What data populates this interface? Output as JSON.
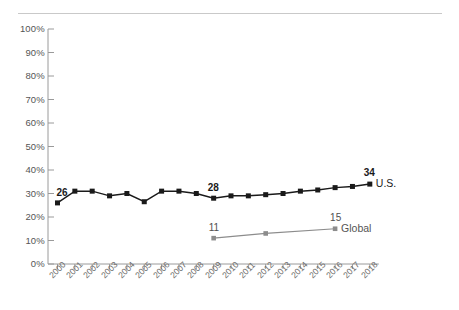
{
  "chart_data": {
    "type": "line",
    "title": "",
    "subtitle": "",
    "xlabel": "",
    "ylabel": "",
    "ylim": [
      0,
      100
    ],
    "grid": false,
    "legend_position": "right-inline",
    "categories": [
      "2000",
      "2001",
      "2002",
      "2003",
      "2004",
      "2005",
      "2006",
      "2007",
      "2008",
      "2009",
      "2010",
      "2011",
      "2012",
      "2013",
      "2014",
      "2015",
      "2016",
      "2017",
      "2018"
    ],
    "y_ticks": [
      "0%",
      "10%",
      "20%",
      "30%",
      "40%",
      "50%",
      "60%",
      "70%",
      "80%",
      "90%",
      "100%"
    ],
    "y_tick_values": [
      0,
      10,
      20,
      30,
      40,
      50,
      60,
      70,
      80,
      90,
      100
    ],
    "series": [
      {
        "name": "U.S.",
        "color": "#1a1a1a",
        "marker": "square",
        "x": [
          "2000",
          "2001",
          "2002",
          "2003",
          "2004",
          "2005",
          "2006",
          "2007",
          "2008",
          "2009",
          "2010",
          "2011",
          "2012",
          "2013",
          "2014",
          "2015",
          "2016",
          "2017",
          "2018"
        ],
        "values": [
          26,
          31,
          31,
          29,
          30,
          26.5,
          31,
          31,
          30,
          28,
          29,
          29,
          29.5,
          30,
          31,
          31.5,
          32.5,
          33,
          34
        ],
        "point_labels": [
          {
            "x": "2000",
            "value": 26,
            "text": "26"
          },
          {
            "x": "2009",
            "value": 28,
            "text": "28"
          },
          {
            "x": "2018",
            "value": 34,
            "text": "34"
          }
        ],
        "end_label": "U.S."
      },
      {
        "name": "Global",
        "color": "#8c8c8c",
        "marker": "square",
        "x": [
          "2009",
          "2012",
          "2016"
        ],
        "values": [
          11,
          13,
          15
        ],
        "point_labels": [
          {
            "x": "2009",
            "value": 11,
            "text": "11"
          },
          {
            "x": "2016",
            "value": 15,
            "text": "15"
          }
        ],
        "end_label": "Global"
      }
    ],
    "annotations": [],
    "colors": {
      "us_line": "#1a1a1a",
      "global_line": "#8c8c8c",
      "axis": "#9a9a9a",
      "background": "#ffffff",
      "top_rule": "#c9c9c9"
    }
  }
}
